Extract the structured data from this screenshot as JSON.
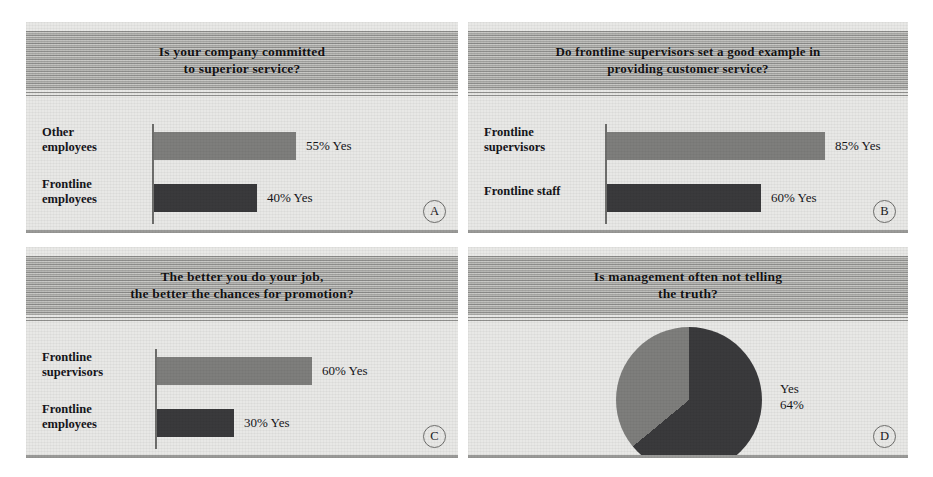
{
  "figure": {
    "background": "#ffffff",
    "panel_background": "#e8e8e6",
    "colors": {
      "bar_light": "#7e7e7c",
      "bar_dark": "#3a3a3c",
      "axis": "#6f6f6d",
      "title_band": "#9d9d9b",
      "text": "#15151a"
    }
  },
  "panels": [
    {
      "badge": "A",
      "title": "Is your company committed\nto superior service?",
      "kind": "bar",
      "bars": [
        {
          "label": "Other\nemployees",
          "value": 55,
          "value_text": "55% Yes",
          "shade": "light"
        },
        {
          "label": "Frontline\nemployees",
          "value": 40,
          "value_text": "40% Yes",
          "shade": "dark"
        }
      ]
    },
    {
      "badge": "B",
      "title": "Do frontline supervisors set a good example in\nproviding customer service?",
      "kind": "bar",
      "bars": [
        {
          "label": "Frontline\nsupervisors",
          "value": 85,
          "value_text": "85% Yes",
          "shade": "light"
        },
        {
          "label": "Frontline staff",
          "value": 60,
          "value_text": "60% Yes",
          "shade": "dark"
        }
      ]
    },
    {
      "badge": "C",
      "title": "The better you do your job,\nthe better the chances for promotion?",
      "kind": "bar",
      "bars": [
        {
          "label": "Frontline\nsupervisors",
          "value": 60,
          "value_text": "60% Yes",
          "shade": "light"
        },
        {
          "label": "Frontline\nemployees",
          "value": 30,
          "value_text": "30% Yes",
          "shade": "dark"
        }
      ]
    },
    {
      "badge": "D",
      "title": "Is management often not telling\nthe truth?",
      "kind": "pie",
      "pie_label": "Yes\n64%",
      "slices": [
        {
          "name": "Yes",
          "value": 64,
          "shade": "dark"
        },
        {
          "name": "No",
          "value": 36,
          "shade": "light"
        }
      ]
    }
  ],
  "chart_data": [
    {
      "type": "bar",
      "panel": "A",
      "title": "Is your company committed to superior service?",
      "orientation": "horizontal",
      "categories": [
        "Other employees",
        "Frontline employees"
      ],
      "values": [
        55,
        40
      ],
      "data_labels": [
        "55% Yes",
        "40% Yes"
      ],
      "xlabel": "",
      "ylabel": "",
      "xlim": [
        0,
        100
      ],
      "grid": false,
      "legend": "none"
    },
    {
      "type": "bar",
      "panel": "B",
      "title": "Do frontline supervisors set a good example in providing customer service?",
      "orientation": "horizontal",
      "categories": [
        "Frontline supervisors",
        "Frontline staff"
      ],
      "values": [
        85,
        60
      ],
      "data_labels": [
        "85% Yes",
        "60% Yes"
      ],
      "xlabel": "",
      "ylabel": "",
      "xlim": [
        0,
        100
      ],
      "grid": false,
      "legend": "none"
    },
    {
      "type": "bar",
      "panel": "C",
      "title": "The better you do your job, the better the chances for promotion?",
      "orientation": "horizontal",
      "categories": [
        "Frontline supervisors",
        "Frontline employees"
      ],
      "values": [
        60,
        30
      ],
      "data_labels": [
        "60% Yes",
        "30% Yes"
      ],
      "xlabel": "",
      "ylabel": "",
      "xlim": [
        0,
        100
      ],
      "grid": false,
      "legend": "none"
    },
    {
      "type": "pie",
      "panel": "D",
      "title": "Is management often not telling the truth?",
      "labels": [
        "Yes",
        "No"
      ],
      "values": [
        64,
        36
      ],
      "data_labels": [
        "Yes 64%",
        ""
      ],
      "start_angle_deg": 0,
      "direction": "clockwise",
      "legend": "none"
    }
  ]
}
